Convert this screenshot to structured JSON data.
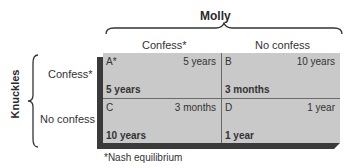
{
  "title": "Molly",
  "row_player": "Knuckles",
  "columns": [
    "Confess*",
    "No confess"
  ],
  "rows": [
    "Confess*",
    "No confess"
  ],
  "cells": [
    {
      "id": "A*",
      "molly": "5 years",
      "knuckles": "5 years"
    },
    {
      "id": "B",
      "molly": "10 years",
      "knuckles": "3 months"
    },
    {
      "id": "C",
      "molly": "3 months",
      "knuckles": "10 years"
    },
    {
      "id": "D",
      "molly": "1 year",
      "knuckles": "1 year"
    }
  ],
  "footnote": "*Nash equilibrium",
  "colors": {
    "cell_fill": "#c9c9c9",
    "edge": "#3a3a3a"
  }
}
